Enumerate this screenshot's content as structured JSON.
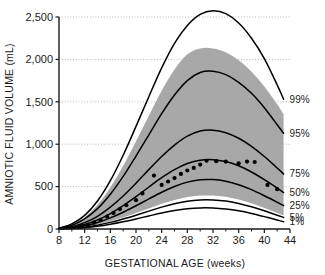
{
  "chart_data": {
    "type": "line",
    "title": "",
    "xlabel": "GESTATIONAL AGE (weeks)",
    "ylabel": "AMNIOTIC FLUID VOLUME (mL)",
    "xlim": [
      8,
      44
    ],
    "ylim": [
      0,
      2500
    ],
    "xticks": [
      8,
      12,
      16,
      20,
      24,
      28,
      32,
      36,
      40,
      44
    ],
    "xticks_minor": [
      10,
      14,
      18,
      22,
      26,
      30,
      34,
      38,
      42
    ],
    "yticks": [
      0,
      500,
      1000,
      1500,
      2000,
      2500
    ],
    "xtick_labels": [
      "8",
      "12",
      "16",
      "20",
      "24",
      "28",
      "32",
      "36",
      "40",
      "44"
    ],
    "ytick_labels": [
      "0",
      "500",
      "1,000",
      "1,500",
      "2,000",
      "2,500"
    ],
    "grid": "horizontal-dotted",
    "legend_position": "right-inline",
    "curve_colors": "#000000",
    "band_color": "#a8a8a8",
    "background_color": "#ffffff",
    "x": [
      8,
      10,
      12,
      14,
      16,
      18,
      20,
      22,
      24,
      26,
      28,
      30,
      32,
      34,
      36,
      38,
      40,
      42,
      43
    ],
    "series": [
      {
        "name": "99%",
        "label": "99%",
        "values": [
          10,
          60,
          160,
          330,
          570,
          870,
          1210,
          1560,
          1900,
          2190,
          2400,
          2530,
          2575,
          2540,
          2430,
          2250,
          2010,
          1700,
          1530
        ]
      },
      {
        "name": "95%",
        "label": "95%",
        "values": [
          8,
          45,
          120,
          240,
          410,
          620,
          860,
          1110,
          1360,
          1580,
          1750,
          1845,
          1860,
          1820,
          1730,
          1600,
          1430,
          1230,
          1130
        ]
      },
      {
        "name": "75%",
        "label": "75%",
        "values": [
          5,
          28,
          75,
          150,
          258,
          390,
          540,
          700,
          855,
          990,
          1095,
          1155,
          1165,
          1135,
          1070,
          975,
          855,
          720,
          650
        ]
      },
      {
        "name": "50%",
        "label": "50%",
        "values": [
          4,
          20,
          53,
          106,
          182,
          276,
          382,
          495,
          605,
          700,
          772,
          812,
          818,
          795,
          745,
          672,
          582,
          482,
          430
        ]
      },
      {
        "name": "25%",
        "label": "25%",
        "values": [
          3,
          14,
          38,
          76,
          131,
          198,
          274,
          355,
          434,
          502,
          553,
          580,
          583,
          563,
          522,
          464,
          392,
          315,
          275
        ]
      },
      {
        "name": "5%",
        "label": "5%",
        "values": [
          2,
          8,
          22,
          45,
          78,
          118,
          163,
          211,
          258,
          298,
          328,
          343,
          343,
          329,
          301,
          262,
          215,
          163,
          137
        ]
      },
      {
        "name": "1%",
        "label": "1%",
        "values": [
          1,
          6,
          16,
          33,
          57,
          86,
          119,
          154,
          188,
          217,
          238,
          249,
          248,
          236,
          214,
          183,
          146,
          106,
          85
        ]
      }
    ],
    "band": {
      "name": "reference-range-band",
      "x": [
        8,
        10,
        12,
        14,
        16,
        18,
        20,
        22,
        24,
        26,
        28,
        30,
        32,
        34,
        36,
        38,
        40,
        42,
        43
      ],
      "upper": [
        9,
        52,
        140,
        285,
        490,
        745,
        1035,
        1335,
        1630,
        1880,
        2060,
        2130,
        2130,
        2085,
        1990,
        1855,
        1680,
        1470,
        1350
      ],
      "lower": [
        2,
        9,
        25,
        52,
        90,
        136,
        188,
        243,
        297,
        343,
        378,
        396,
        396,
        380,
        348,
        303,
        249,
        189,
        160
      ]
    },
    "scatter": {
      "name": "observed-means",
      "points": [
        [
          11.5,
          30
        ],
        [
          12.5,
          50
        ],
        [
          13.5,
          75
        ],
        [
          14.5,
          105
        ],
        [
          15.5,
          145
        ],
        [
          16.5,
          190
        ],
        [
          17.5,
          235
        ],
        [
          18.5,
          280
        ],
        [
          20.0,
          340
        ],
        [
          21.0,
          420
        ],
        [
          22.8,
          630
        ],
        [
          24.0,
          520
        ],
        [
          25.0,
          560
        ],
        [
          26.0,
          600
        ],
        [
          27.0,
          650
        ],
        [
          28.0,
          690
        ],
        [
          29.0,
          720
        ],
        [
          30.0,
          760
        ],
        [
          31.0,
          805
        ],
        [
          32.5,
          800
        ],
        [
          34.0,
          795
        ],
        [
          36.0,
          775
        ],
        [
          37.3,
          795
        ],
        [
          38.5,
          790
        ],
        [
          40.5,
          520
        ],
        [
          42.0,
          470
        ]
      ]
    },
    "percentile_labels": [
      {
        "label": "99%",
        "y_value": 1530
      },
      {
        "label": "95%",
        "y_value": 1130
      },
      {
        "label": "75%",
        "y_value": 650
      },
      {
        "label": "50%",
        "y_value": 430
      },
      {
        "label": "25%",
        "y_value": 275
      },
      {
        "label": "5%",
        "y_value": 137
      },
      {
        "label": "1%",
        "y_value": 85
      }
    ]
  }
}
